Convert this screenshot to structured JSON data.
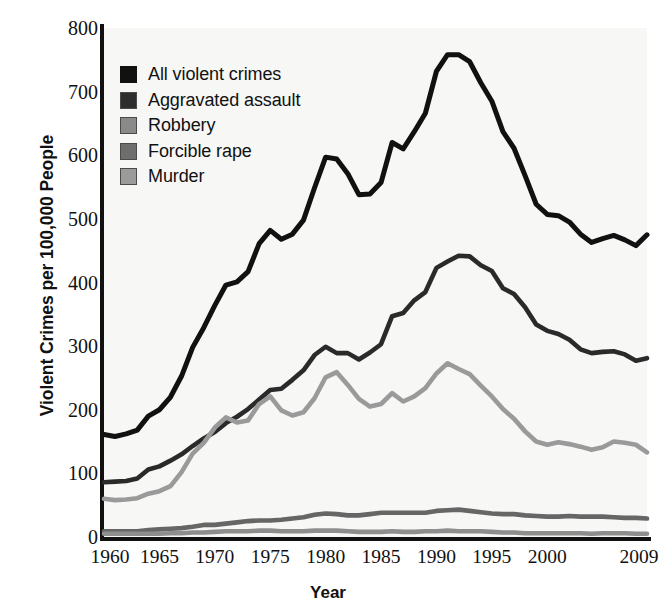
{
  "chart_data": {
    "type": "line",
    "title": "",
    "xlabel": "Year",
    "ylabel": "Violent Crimes per 100,000 People",
    "xlim": [
      1960,
      2009
    ],
    "ylim": [
      0,
      800
    ],
    "grid": false,
    "legend_position": "top-left",
    "x_tick_labels": [
      "1960",
      "1965",
      "1970",
      "1975",
      "1980",
      "1985",
      "1990",
      "1995",
      "2000",
      "2009"
    ],
    "x_tick_values": [
      1960,
      1965,
      1970,
      1975,
      1980,
      1985,
      1990,
      1995,
      2000,
      2009
    ],
    "y_tick_labels": [
      "0",
      "100",
      "200",
      "300",
      "400",
      "500",
      "600",
      "700",
      "800"
    ],
    "y_tick_values": [
      0,
      100,
      200,
      300,
      400,
      500,
      600,
      700,
      800
    ],
    "x": [
      1960,
      1961,
      1962,
      1963,
      1964,
      1965,
      1966,
      1967,
      1968,
      1969,
      1970,
      1971,
      1972,
      1973,
      1974,
      1975,
      1976,
      1977,
      1978,
      1979,
      1980,
      1981,
      1982,
      1983,
      1984,
      1985,
      1986,
      1987,
      1988,
      1989,
      1990,
      1991,
      1992,
      1993,
      1994,
      1995,
      1996,
      1997,
      1998,
      1999,
      2000,
      2001,
      2002,
      2003,
      2004,
      2005,
      2006,
      2007,
      2008,
      2009
    ],
    "series": [
      {
        "name": "All violent crimes",
        "color": "#111111",
        "values": [
          161,
          158,
          162,
          168,
          190,
          200,
          220,
          253,
          298,
          329,
          364,
          396,
          401,
          417,
          461,
          482,
          468,
          476,
          498,
          549,
          597,
          594,
          571,
          538,
          539,
          557,
          620,
          610,
          637,
          666,
          732,
          758,
          758,
          747,
          714,
          685,
          637,
          611,
          568,
          523,
          507,
          505,
          495,
          476,
          463,
          469,
          474,
          467,
          458,
          475
        ]
      },
      {
        "name": "Aggravated assault",
        "color": "#2a2a2a",
        "values": [
          86,
          87,
          88,
          92,
          106,
          111,
          120,
          130,
          143,
          155,
          165,
          179,
          189,
          201,
          216,
          231,
          233,
          247,
          262,
          286,
          299,
          289,
          289,
          279,
          290,
          303,
          347,
          352,
          372,
          385,
          423,
          433,
          442,
          441,
          427,
          418,
          391,
          382,
          361,
          334,
          324,
          319,
          310,
          295,
          289,
          291,
          292,
          287,
          277,
          281
        ]
      },
      {
        "name": "Robbery",
        "color": "#9a9a9a",
        "values": [
          60,
          58,
          59,
          61,
          68,
          72,
          80,
          102,
          131,
          148,
          172,
          188,
          180,
          183,
          209,
          221,
          199,
          191,
          196,
          218,
          251,
          259,
          239,
          217,
          205,
          209,
          226,
          213,
          221,
          234,
          257,
          273,
          264,
          256,
          238,
          221,
          201,
          186,
          166,
          150,
          145,
          149,
          146,
          142,
          137,
          141,
          150,
          148,
          145,
          133
        ]
      },
      {
        "name": "Forcible rape",
        "color": "#666666",
        "values": [
          9,
          9,
          9,
          9,
          11,
          12,
          13,
          14,
          16,
          19,
          19,
          21,
          23,
          25,
          26,
          26,
          27,
          29,
          31,
          35,
          37,
          36,
          34,
          34,
          36,
          38,
          38,
          38,
          38,
          38,
          41,
          42,
          43,
          41,
          39,
          37,
          36,
          36,
          34,
          33,
          32,
          32,
          33,
          32,
          32,
          32,
          31,
          30,
          30,
          29
        ]
      },
      {
        "name": "Murder",
        "color": "#8e8e8e",
        "values": [
          5,
          5,
          5,
          5,
          5,
          5,
          6,
          6,
          7,
          7,
          8,
          9,
          9,
          9,
          10,
          10,
          9,
          9,
          9,
          10,
          10,
          10,
          9,
          8,
          8,
          8,
          9,
          8,
          8,
          9,
          9,
          10,
          9,
          9,
          9,
          8,
          7,
          7,
          6,
          6,
          6,
          6,
          6,
          6,
          5,
          6,
          6,
          6,
          5,
          5
        ]
      }
    ]
  },
  "legend": {
    "items": [
      {
        "label": "All violent crimes",
        "swatch_color": "#111111"
      },
      {
        "label": "Aggravated assault",
        "swatch_color": "#2e2e2e"
      },
      {
        "label": "Robbery",
        "swatch_color": "#8a8a8a"
      },
      {
        "label": "Forcible rape",
        "swatch_color": "#6e6e6e"
      },
      {
        "label": "Murder",
        "swatch_color": "#9b9b9b"
      }
    ]
  },
  "axes": {
    "y_title": "Violent Crimes per 100,000 People",
    "x_title": "Year"
  },
  "colors": {
    "plot_background": "#f7f7f5",
    "page_background": "#ffffff",
    "axis": "#111111",
    "text": "#111111"
  }
}
